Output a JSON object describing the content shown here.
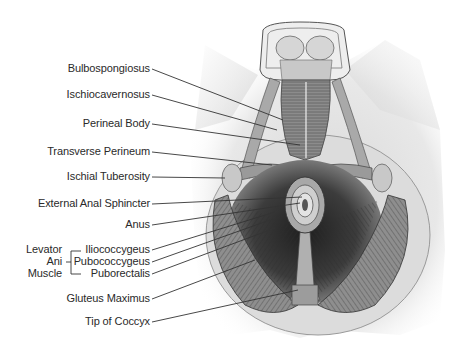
{
  "figure": {
    "type": "anatomical-illustration",
    "labels": [
      {
        "id": "bulbospongiosus",
        "text": "Bulbospongiosus",
        "x_end": 150,
        "y": 69,
        "target": [
          283,
          120
        ]
      },
      {
        "id": "ischiocavernosus",
        "text": "Ischiocavernosus",
        "x_end": 150,
        "y": 95,
        "target": [
          277,
          130
        ]
      },
      {
        "id": "perineal-body",
        "text": "Perineal Body",
        "x_end": 150,
        "y": 124,
        "target": [
          300,
          145
        ]
      },
      {
        "id": "transverse-perineum",
        "text": "Transverse Perineum",
        "x_end": 150,
        "y": 152,
        "target": [
          272,
          165
        ]
      },
      {
        "id": "ischial-tuberosity",
        "text": "Ischial Tuberosity",
        "x_end": 150,
        "y": 177,
        "target": [
          225,
          178
        ]
      },
      {
        "id": "external-anal-sphincter",
        "text": "External Anal Sphincter",
        "x_end": 150,
        "y": 204,
        "target": [
          302,
          197
        ]
      },
      {
        "id": "anus",
        "text": "Anus",
        "x_end": 150,
        "y": 225,
        "target": [
          300,
          203
        ]
      },
      {
        "id": "iliococcygeus",
        "text": "Iliococcygeus",
        "x_end": 150,
        "y": 250,
        "target": [
          275,
          212
        ]
      },
      {
        "id": "pubococcygeus",
        "text": "Pubococcygeus",
        "x_end": 150,
        "y": 262,
        "target": [
          270,
          220
        ]
      },
      {
        "id": "puborectalis",
        "text": "Puborectalis",
        "x_end": 150,
        "y": 274,
        "target": [
          275,
          228
        ]
      },
      {
        "id": "gluteus-maximus",
        "text": "Gluteus Maximus",
        "x_end": 150,
        "y": 299,
        "target": [
          255,
          260
        ]
      },
      {
        "id": "tip-of-coccyx",
        "text": "Tip of Coccyx",
        "x_end": 150,
        "y": 322,
        "target": [
          298,
          290
        ]
      }
    ],
    "group_label": {
      "lines": [
        "Levator",
        "Ani",
        "Muscle"
      ],
      "bracket_members": [
        "Iliococcygeus",
        "Pubococcygeus",
        "Puborectalis"
      ]
    }
  },
  "colors": {
    "label_text": "#2a2a2a",
    "leader_line": "#333333",
    "skin": "#e6e6e6",
    "muscle_dark": "#3a3a3a",
    "muscle_mid": "#7a7a7a",
    "muscle_light": "#b8b8b8"
  }
}
